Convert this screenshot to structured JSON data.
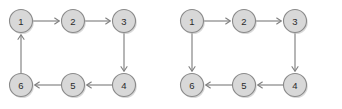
{
  "figure": {
    "kind": "directed-graph-pair",
    "width": 342,
    "height": 109,
    "background_color": "#ffffff"
  },
  "style": {
    "node_fill_color": "#d8d8d8",
    "node_stroke_color": "#8a8a8a",
    "node_label_color": "#2b2b2b",
    "node_shadow_color": "#b9b9b9",
    "edge_color": "#808080",
    "arrow_color": "#808080",
    "node_radius": 11.5
  },
  "diagrams": [
    {
      "id": "diagram-left",
      "name": "left-directed-cycle",
      "origin_x": 0,
      "nodes": [
        {
          "id": "1",
          "label": "1",
          "cx": 21,
          "cy": 21
        },
        {
          "id": "2",
          "label": "2",
          "cx": 73,
          "cy": 21
        },
        {
          "id": "3",
          "label": "3",
          "cx": 124,
          "cy": 21
        },
        {
          "id": "4",
          "label": "4",
          "cx": 124,
          "cy": 85
        },
        {
          "id": "5",
          "label": "5",
          "cx": 73,
          "cy": 85
        },
        {
          "id": "6",
          "label": "6",
          "cx": 21,
          "cy": 85
        }
      ],
      "edges": [
        {
          "from": "1",
          "to": "2",
          "direction": "right",
          "arrow_at_target": true
        },
        {
          "from": "2",
          "to": "3",
          "direction": "right",
          "arrow_at_target": true
        },
        {
          "from": "3",
          "to": "4",
          "direction": "down",
          "arrow_at_target": true
        },
        {
          "from": "4",
          "to": "5",
          "direction": "left",
          "arrow_at_target": true
        },
        {
          "from": "5",
          "to": "6",
          "direction": "left",
          "arrow_at_target": true
        },
        {
          "from": "6",
          "to": "1",
          "direction": "up",
          "arrow_at_target": true
        }
      ]
    },
    {
      "id": "diagram-right",
      "name": "right-directed-graph",
      "origin_x": 171,
      "nodes": [
        {
          "id": "1",
          "label": "1",
          "cx": 21,
          "cy": 21
        },
        {
          "id": "2",
          "label": "2",
          "cx": 73,
          "cy": 21
        },
        {
          "id": "3",
          "label": "3",
          "cx": 124,
          "cy": 21
        },
        {
          "id": "4",
          "label": "4",
          "cx": 124,
          "cy": 85
        },
        {
          "id": "5",
          "label": "5",
          "cx": 73,
          "cy": 85
        },
        {
          "id": "6",
          "label": "6",
          "cx": 21,
          "cy": 85
        }
      ],
      "edges": [
        {
          "from": "1",
          "to": "2",
          "direction": "right",
          "arrow_at_target": true
        },
        {
          "from": "2",
          "to": "3",
          "direction": "right",
          "arrow_at_target": true
        },
        {
          "from": "3",
          "to": "4",
          "direction": "down",
          "arrow_at_target": true
        },
        {
          "from": "4",
          "to": "5",
          "direction": "left",
          "arrow_at_target": true
        },
        {
          "from": "5",
          "to": "6",
          "direction": "left",
          "arrow_at_target": true
        },
        {
          "from": "1",
          "to": "6",
          "direction": "down",
          "arrow_at_target": true
        }
      ]
    }
  ]
}
